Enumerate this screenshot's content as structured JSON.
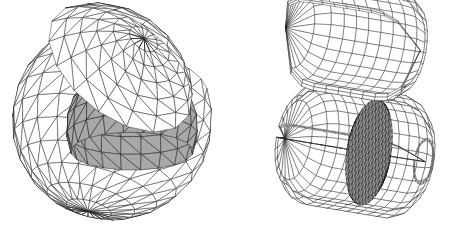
{
  "figure": {
    "title": "",
    "background_color": "#ffffff",
    "width": 465,
    "height": 233,
    "line_color": "#1a1a1a",
    "shaded_fill_color": "#a8a8a8",
    "shell_fill_color": "#ffffff",
    "panels": [
      {
        "id": "left-panel",
        "name": "triangulated-sphere-cutaway",
        "label": "",
        "mesh_type": "triangular",
        "center": [
          112,
          120
        ],
        "outer_radius": 100,
        "inner_radius": 66,
        "parts": [
          {
            "name": "outer-shell-bowl",
            "mesh_type": "triangular",
            "fill": "#ffffff",
            "rings": 9,
            "sectors": 22
          },
          {
            "name": "outer-shell-cap",
            "mesh_type": "triangular",
            "fill": "#ffffff",
            "rings": 6,
            "sectors": 16,
            "tilt_degrees": -28
          },
          {
            "name": "inner-shaded-dome",
            "mesh_type": "triangular",
            "fill": "#a8a8a8",
            "rings": 7,
            "sectors": 20
          }
        ]
      },
      {
        "id": "right-panel",
        "name": "quad-meshed-capsule-cutaway",
        "label": "",
        "mesh_type": "quadrilateral",
        "center": [
          355,
          150
        ],
        "parts": [
          {
            "name": "detached-curved-lid",
            "mesh_type": "quadrilateral",
            "fill": "#ffffff",
            "rows": 7,
            "columns": 16
          },
          {
            "name": "capsule-shell-body",
            "mesh_type": "quadrilateral",
            "fill": "#ffffff",
            "rows": 12,
            "columns": 22
          },
          {
            "name": "shaded-triangulated-endcap",
            "mesh_type": "triangular",
            "fill": "#a8a8a8",
            "rows": 16,
            "columns": 14
          }
        ]
      }
    ]
  }
}
